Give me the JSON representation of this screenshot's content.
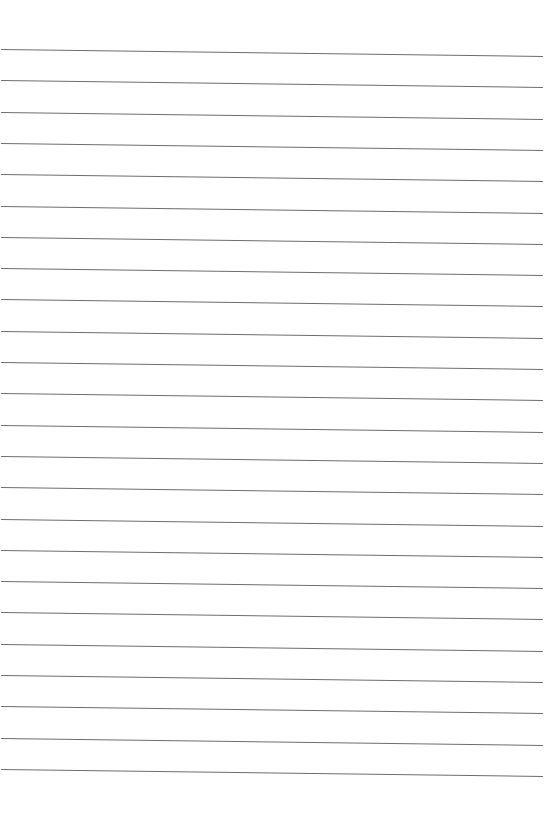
{
  "document": {
    "type": "lined-paper",
    "background_color": "#ffffff",
    "line_color": "#6e6e6e",
    "line_count": 24,
    "first_line_y": 49,
    "line_spacing": 31.3,
    "line_slant_px": 7,
    "text": ""
  }
}
